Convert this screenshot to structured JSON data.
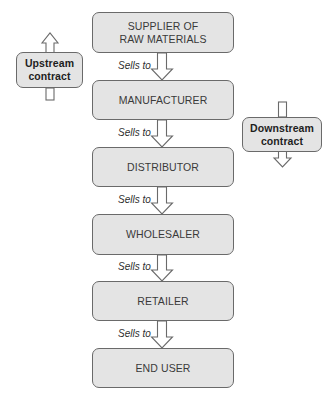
{
  "diagram": {
    "chain": [
      {
        "label_line1": "SUPPLIER OF",
        "label_line2": "RAW MATERIALS"
      },
      {
        "label_line1": "MANUFACTURER",
        "label_line2": ""
      },
      {
        "label_line1": "DISTRIBUTOR",
        "label_line2": ""
      },
      {
        "label_line1": "WHOLESALER",
        "label_line2": ""
      },
      {
        "label_line1": "RETAILER",
        "label_line2": ""
      },
      {
        "label_line1": "END USER",
        "label_line2": ""
      }
    ],
    "connectors": [
      {
        "label": "Sells to"
      },
      {
        "label": "Sells to"
      },
      {
        "label": "Sells to"
      },
      {
        "label": "Sells to"
      },
      {
        "label": "Sells to"
      }
    ],
    "upstream": {
      "line1": "Upstream",
      "line2": "contract",
      "direction": "up"
    },
    "downstream": {
      "line1": "Downstream",
      "line2": "contract",
      "direction": "down"
    },
    "colors": {
      "box_fill": "#e4e4e4",
      "box_border": "#6a6a6a",
      "text": "#3a3a3a",
      "arrow_stroke": "#6a6a6a",
      "arrow_fill": "#ffffff"
    }
  }
}
